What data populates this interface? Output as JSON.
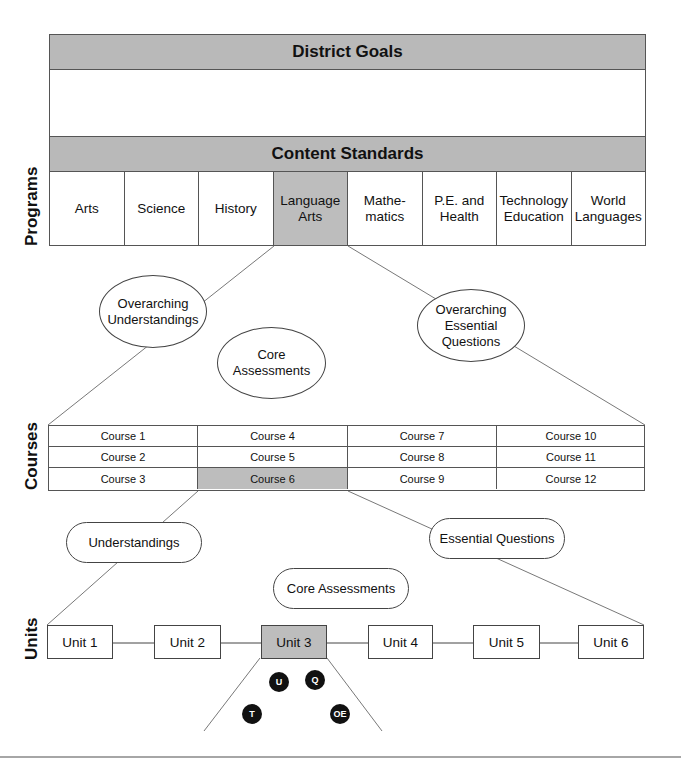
{
  "top": {
    "district_goals": "District Goals",
    "content_standards": "Content Standards"
  },
  "levels": {
    "programs": "Programs",
    "courses": "Courses",
    "units": "Units"
  },
  "programs": [
    {
      "label": "Arts",
      "highlighted": false
    },
    {
      "label": "Science",
      "highlighted": false
    },
    {
      "label": "History",
      "highlighted": false
    },
    {
      "label": "Language\nArts",
      "highlighted": true
    },
    {
      "label": "Mathe-\nmatics",
      "highlighted": false
    },
    {
      "label": "P.E. and\nHealth",
      "highlighted": false
    },
    {
      "label": "Technology\nEducation",
      "highlighted": false
    },
    {
      "label": "World\nLanguages",
      "highlighted": false
    }
  ],
  "program_level": {
    "overarching_understandings": "Overarching\nUnderstandings",
    "overarching_essential_questions": "Overarching\nEssential\nQuestions",
    "core_assessments": "Core Assessments"
  },
  "courses": [
    [
      "Course 1",
      "Course 4",
      "Course 7",
      "Course 10"
    ],
    [
      "Course 2",
      "Course 5",
      "Course 8",
      "Course 11"
    ],
    [
      "Course 3",
      "Course 6",
      "Course 9",
      "Course 12"
    ]
  ],
  "highlighted_course": "Course 6",
  "course_level": {
    "understandings": "Understandings",
    "essential_questions": "Essential Questions",
    "core_assessments": "Core Assessments"
  },
  "units": [
    {
      "label": "Unit 1",
      "highlighted": false
    },
    {
      "label": "Unit 2",
      "highlighted": false
    },
    {
      "label": "Unit 3",
      "highlighted": true
    },
    {
      "label": "Unit 4",
      "highlighted": false
    },
    {
      "label": "Unit 5",
      "highlighted": false
    },
    {
      "label": "Unit 6",
      "highlighted": false
    }
  ],
  "unit_markers": [
    {
      "label": "U"
    },
    {
      "label": "Q"
    },
    {
      "label": "T"
    },
    {
      "label": "OE"
    }
  ],
  "colors": {
    "highlight": "#bdbdbd",
    "band": "#b9b9b9",
    "marker": "#111111"
  }
}
